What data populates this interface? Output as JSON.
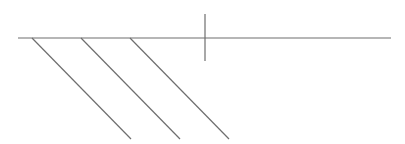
{
  "diagram": {
    "width": 405,
    "height": 144,
    "background": "#ffffff",
    "stroke_color": "#6e6e6e",
    "stroke_width": 1.2,
    "baseline": {
      "x1": 18,
      "y1": 38,
      "x2": 391,
      "y2": 38
    },
    "tick": {
      "x1": 205,
      "y1": 14,
      "x2": 205,
      "y2": 61
    },
    "hatch_lines": [
      {
        "x1": 32,
        "y1": 38,
        "x2": 131,
        "y2": 139
      },
      {
        "x1": 81,
        "y1": 38,
        "x2": 180,
        "y2": 139
      },
      {
        "x1": 130,
        "y1": 38,
        "x2": 229,
        "y2": 139
      }
    ]
  }
}
